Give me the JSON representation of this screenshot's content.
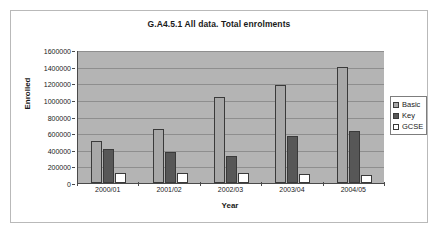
{
  "chart_data": {
    "type": "bar",
    "title": "G.A4.5.1 All data. Total enrolments",
    "xlabel": "Year",
    "ylabel": "Enrolled",
    "categories": [
      "2000/01",
      "2001/02",
      "2002/03",
      "2003/04",
      "2004/05"
    ],
    "series": [
      {
        "name": "Basic",
        "color": "#a8a8a8",
        "values": [
          500000,
          650000,
          1030000,
          1185000,
          1390000
        ]
      },
      {
        "name": "Key",
        "color": "#575757",
        "values": [
          410000,
          375000,
          320000,
          565000,
          630000
        ]
      },
      {
        "name": "GCSE",
        "color": "#ffffff",
        "values": [
          120000,
          115000,
          120000,
          105000,
          95000
        ]
      }
    ],
    "ylim": [
      0,
      1600000
    ],
    "ytick_step": 200000,
    "ytick_labels": [
      "0",
      "200000",
      "400000",
      "600000",
      "800000",
      "1000000",
      "1200000",
      "1400000",
      "1600000"
    ],
    "grid": true,
    "legend_position": "right",
    "plot_background": "#b4b4b4"
  }
}
